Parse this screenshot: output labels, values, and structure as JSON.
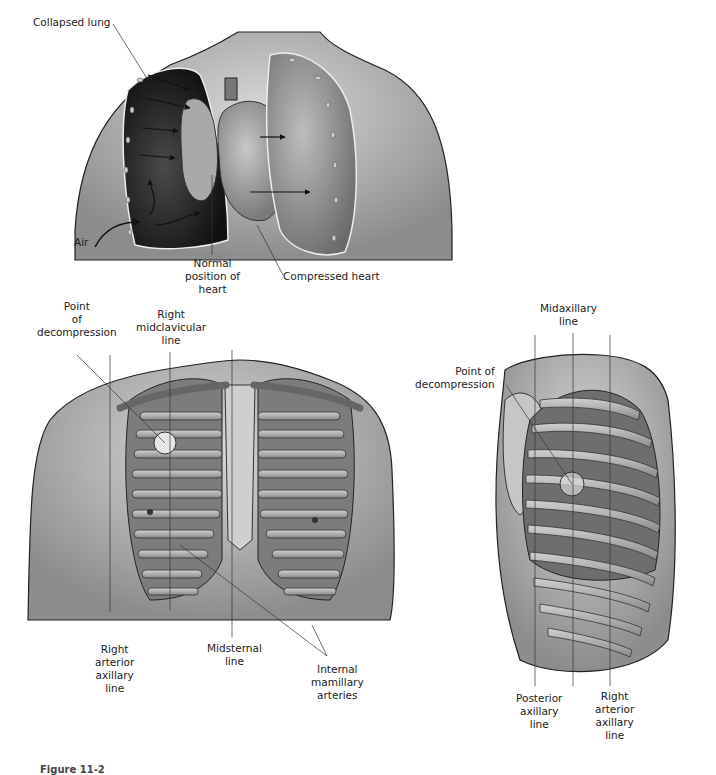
{
  "top_panel": {
    "title": "Tension pneumothorax",
    "labels": {
      "collapsed_lung": "Collapsed lung",
      "air": "Air",
      "normal_position_of_heart": [
        "Normal",
        "position of",
        "heart"
      ],
      "compressed_heart": "Compressed heart"
    }
  },
  "front_panel": {
    "labels": {
      "point_of_decompression": [
        "Point",
        "of",
        "decompression"
      ],
      "right_midclavicular_line": [
        "Right",
        "midclavicular",
        "line"
      ],
      "right_anterior_axillary_line": [
        "Right",
        "arterior",
        "axillary",
        "line"
      ],
      "midsternal_line": [
        "Midsternal",
        "line"
      ],
      "internal_mamillary_arteries": [
        "Internal",
        "mamillary",
        "arteries"
      ]
    }
  },
  "side_panel": {
    "labels": {
      "midaxillary_line": [
        "Midaxillary",
        "line"
      ],
      "point_of_decompression": [
        "Point of",
        "decompression"
      ],
      "posterior_axillary_line": [
        "Posterior",
        "axillary",
        "line"
      ],
      "right_anterior_axillary_line": [
        "Right",
        "arterior",
        "axillary",
        "line"
      ]
    }
  },
  "caption": "Figure 11-2",
  "colors": {
    "skin": "#bdbdbd",
    "lung_dark": "#2a2a2a",
    "rib": "#9a9a9a",
    "line": "#333333"
  }
}
